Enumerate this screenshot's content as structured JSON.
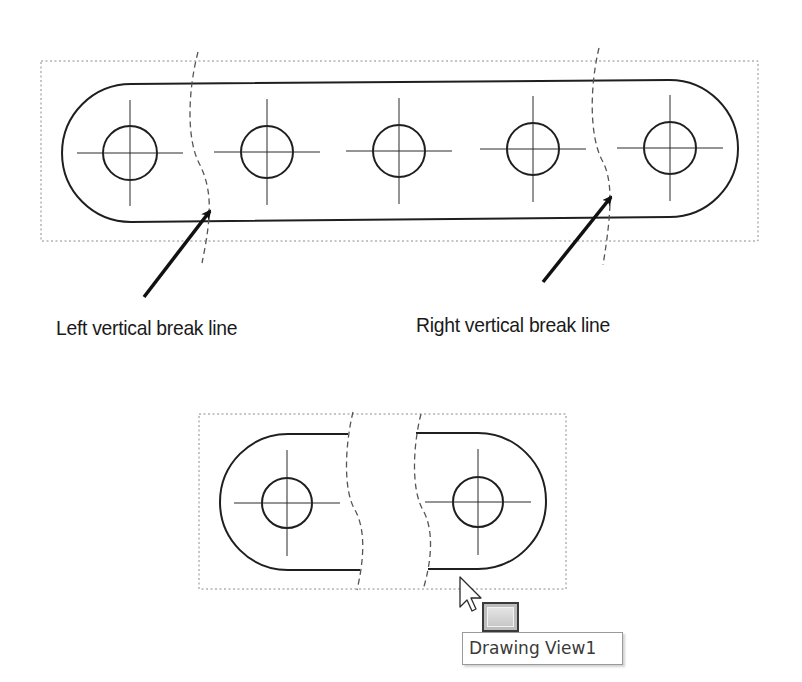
{
  "app": "Drawing sheet (break view illustration)",
  "colors": {
    "background": "#ffffff",
    "outline": "#1f1f1f",
    "centerline": "#2a2a2a",
    "break_line": "#555555",
    "view_border": "#8a8a8a",
    "arrow": "#111111",
    "label_text": "#1a1a1a",
    "tooltip_text": "#3a3a3a"
  },
  "callouts": {
    "left": {
      "label": "Left vertical break line",
      "x": 56,
      "y": 316,
      "arrow_from": [
        144,
        297
      ],
      "arrow_to": [
        210,
        211
      ]
    },
    "right": {
      "label": "Right vertical break line",
      "x": 416,
      "y": 313,
      "arrow_from": [
        543,
        282
      ],
      "arrow_to": [
        611,
        197
      ]
    }
  },
  "top_view": {
    "name": "Unbroken view with break lines",
    "border": {
      "x": 41,
      "y": 61,
      "w": 717,
      "h": 180
    },
    "slot": {
      "left_x": 62,
      "right_x": 738,
      "top_left_y": 84,
      "top_right_y": 80,
      "bottom_left_y": 222,
      "bottom_right_y": 217
    },
    "holes": [
      {
        "cx": 130,
        "cy": 153,
        "r": 27
      },
      {
        "cx": 267,
        "cy": 152,
        "r": 26
      },
      {
        "cx": 399,
        "cy": 151,
        "r": 26
      },
      {
        "cx": 533,
        "cy": 149,
        "r": 26
      },
      {
        "cx": 670,
        "cy": 148,
        "r": 26
      }
    ],
    "centerline_half_length": 53,
    "break_lines": [
      {
        "id": "left",
        "path": "M198 52 C 188 90, 186 140, 200 165 C 212 190, 212 215, 202 263"
      },
      {
        "id": "right",
        "path": "M599 48 C 590 85, 589 135, 602 160 C 613 180, 612 210, 603 265"
      }
    ]
  },
  "bottom_view": {
    "name": "Drawing View1",
    "border": {
      "x": 199,
      "y": 414,
      "w": 367,
      "h": 175
    },
    "left_piece": {
      "left_x": 220,
      "top_y": 434,
      "bottom_y": 570,
      "top_end_x": 348,
      "bottom_end_x": 360
    },
    "right_piece": {
      "right_x": 546,
      "top_y": 433,
      "bottom_y": 569,
      "top_start_x": 416,
      "bottom_start_x": 428
    },
    "holes": [
      {
        "cx": 287,
        "cy": 503,
        "r": 25
      },
      {
        "cx": 478,
        "cy": 502,
        "r": 25
      }
    ],
    "centerline_half_length": 53,
    "break_lines": [
      {
        "id": "left",
        "path": "M353 412 C 345 445, 343 490, 355 510 C 366 530, 364 560, 357 590"
      },
      {
        "id": "right",
        "path": "M421 414 C 413 445, 411 490, 423 510 C 434 530, 432 560, 423 590"
      }
    ]
  },
  "cursor": {
    "type": "arrow-pointer",
    "x": 460,
    "y": 577
  },
  "tooltip": {
    "icon": "drawing-view-icon",
    "label": "Drawing View1"
  }
}
